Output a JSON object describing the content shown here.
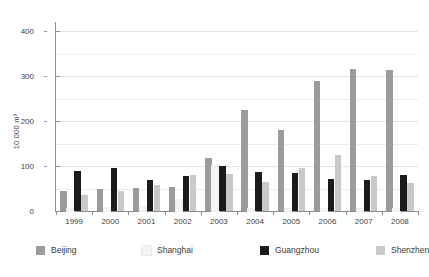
{
  "chart_data": {
    "type": "bar",
    "title": "",
    "subtitle": "",
    "xlabel": "",
    "ylabel": "10 000 m³",
    "categories": [
      "1999",
      "2000",
      "2001",
      "2002",
      "2003",
      "2004",
      "2005",
      "2006",
      "2007",
      "2008"
    ],
    "ylim": [
      0,
      420
    ],
    "yticks": [
      0,
      100,
      200,
      300,
      400
    ],
    "ytick_labels": [
      "0",
      "100",
      "200",
      "300",
      "400"
    ],
    "grid": true,
    "grid_orientation": "horizontal",
    "legend_position": "bottom",
    "series": [
      {
        "name": "Beijing",
        "color": "#9c9c9c",
        "values": [
          45,
          48,
          52,
          53,
          118,
          225,
          180,
          290,
          315,
          313
        ]
      },
      {
        "name": "Shanghai",
        "color": "#f4f4f4",
        "values": [
          4,
          6,
          8,
          25,
          100,
          5,
          5,
          5,
          5,
          5
        ]
      },
      {
        "name": "Guangzhou",
        "color": "#1b1b1b",
        "values": [
          90,
          95,
          68,
          78,
          100,
          86,
          85,
          72,
          70,
          80
        ]
      },
      {
        "name": "Shenzhen",
        "color": "#c9c9c9",
        "values": [
          36,
          45,
          58,
          80,
          83,
          65,
          95,
          125,
          77,
          62
        ]
      }
    ]
  },
  "axes": {
    "y_title": "10 000 m³"
  },
  "legend": {
    "items": [
      {
        "label": "Beijing",
        "color": "#9c9c9c"
      },
      {
        "label": "Shanghai",
        "color": "#f4f4f4"
      },
      {
        "label": "Guangzhou",
        "color": "#1b1b1b"
      },
      {
        "label": "Shenzhen",
        "color": "#c9c9c9"
      }
    ]
  }
}
